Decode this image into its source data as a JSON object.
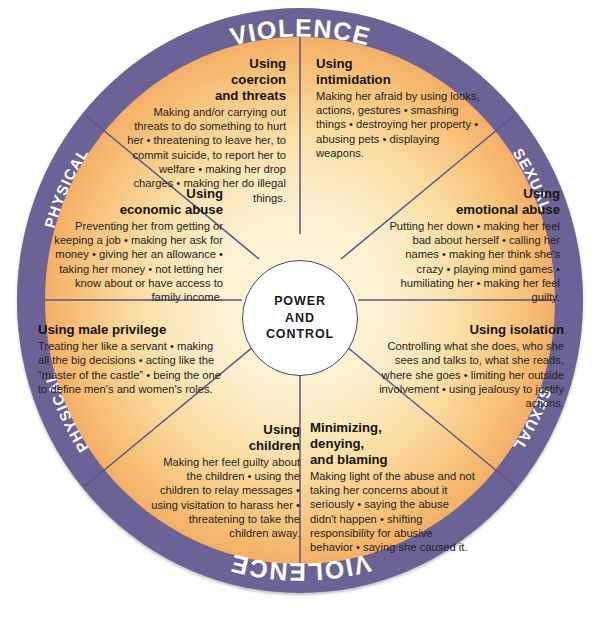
{
  "diagram": {
    "hub": {
      "line1": "POWER",
      "line2": "AND",
      "line3": "CONTROL"
    },
    "ring": {
      "top_left_label": "PHYSICAL",
      "top_center_label": "VIOLENCE",
      "top_right_label": "SEXUAL",
      "bottom_left_label": "PHYSICAL",
      "bottom_center_label": "VIOLENCE",
      "bottom_right_label": "SEXUAL"
    },
    "caption": "",
    "colors": {
      "ring_purple": "#6b6395",
      "rim_orange": "#e8823f",
      "center_cream": "#fdf6dc",
      "hub_white": "#ffffff",
      "spoke_line": "#5b5480",
      "text_dark": "#231f1b",
      "ring_text_white": "#ffffff"
    },
    "wedges": [
      {
        "id": "coercion-and-threats",
        "title": "Using\ncoercion\nand threats",
        "title_lines": [
          "Using",
          "coercion",
          "and threats"
        ],
        "body": "Making and/or carrying out threats to do something to hurt her • threatening to leave her, to commit suicide, to report her to welfare • making her drop charges • making her do illegal things.",
        "align": "right"
      },
      {
        "id": "intimidation",
        "title": "Using\nintimidation",
        "title_lines": [
          "Using",
          "intimidation"
        ],
        "body": "Making her afraid by using looks, actions, gestures • smashing things • destroying her property • abusing pets • displaying weapons.",
        "align": "left"
      },
      {
        "id": "economic-abuse",
        "title": "Using\neconomic abuse",
        "title_lines": [
          "Using",
          "economic abuse"
        ],
        "body": "Preventing her from getting or keeping a job • making her ask for money • giving her an allowance • taking her money • not letting her know about or have access to family income.",
        "align": "right"
      },
      {
        "id": "emotional-abuse",
        "title": "Using\nemotional abuse",
        "title_lines": [
          "Using",
          "emotional abuse"
        ],
        "body": "Putting her down • making her feel bad about herself • calling her names • making her think she's crazy • playing mind games • humiliating her • making her feel guilty.",
        "align": "right"
      },
      {
        "id": "male-privilege",
        "title": "Using male privilege",
        "title_lines": [
          "Using male privilege"
        ],
        "body": "Treating her like a servant • making all the big decisions • acting like the “master of the castle” • being the one to define men's and women's roles.",
        "align": "left"
      },
      {
        "id": "isolation",
        "title": "Using isolation",
        "title_lines": [
          "Using isolation"
        ],
        "body": "Controlling what she does, who she sees and talks to, what she reads, where she goes • limiting her outside involvement • using jealousy to justify actions.",
        "align": "right"
      },
      {
        "id": "using-children",
        "title": "Using\nchildren",
        "title_lines": [
          "Using",
          "children"
        ],
        "body": "Making her feel guilty about the children • using the children to relay messages • using visitation to harass her • threatening to take the children away.",
        "align": "right"
      },
      {
        "id": "minimizing-denying-blaming",
        "title": "Minimizing,\ndenying,\nand blaming",
        "title_lines": [
          "Minimizing,",
          "denying,",
          "and blaming"
        ],
        "body": "Making light of the abuse and not taking her concerns about it seriously • saying the abuse didn't happen • shifting responsibility for abusive behavior • saying she caused it.",
        "align": "left"
      }
    ]
  }
}
